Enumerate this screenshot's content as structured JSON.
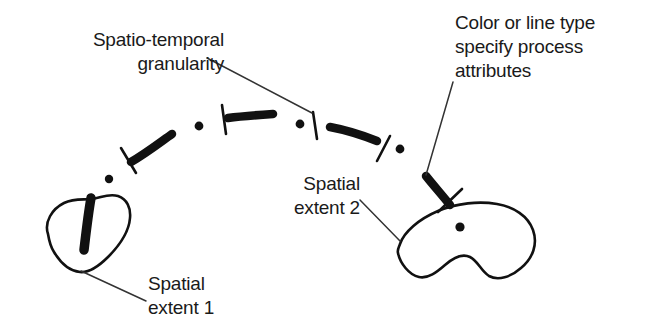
{
  "figure": {
    "background_color": "#ffffff",
    "ink_color": "#000000",
    "text_color": "#1a1a1a"
  },
  "annotations": {
    "granularity": "Spatio-temporal\ngranularity",
    "attributes": "Color or line type\nspecify process\nattributes",
    "extent2": "Spatial\nextent 2",
    "extent1": "Spatial\nextent 1"
  },
  "icons": {
    "blob_left": "spatial-extent-blob-icon",
    "blob_right": "spatial-extent-blob-icon",
    "dash": "thick-dash-icon",
    "dot": "dot-icon",
    "tick": "granularity-tick-icon",
    "leader": "leader-line-icon"
  }
}
